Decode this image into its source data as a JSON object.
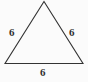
{
  "figure": {
    "kind": "equilateral-triangle",
    "background_color": "#fbfbfb",
    "stroke_color": "#333333",
    "stroke_width": 1.1,
    "label_color": "#303030",
    "vertices": {
      "apex": {
        "x": 44,
        "y": 1.5
      },
      "bottom_left": {
        "x": 5,
        "y": 63.5
      },
      "bottom_right": {
        "x": 83,
        "y": 63.5
      }
    },
    "labels": {
      "left_side": "6",
      "right_side": "6",
      "base": "6"
    }
  }
}
